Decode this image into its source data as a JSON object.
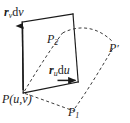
{
  "figure": {
    "background_color": "#ffffff",
    "stroke_color": "#1a1a1a",
    "dashed_color": "#3a3a3a",
    "labels": {
      "rv_dv": {
        "vector": "r",
        "subscript": "v",
        "differential": "dv",
        "text": "r_v dv"
      },
      "ru_du": {
        "vector": "r",
        "subscript": "u",
        "differential": "du",
        "text": "r_u du"
      },
      "P_uv": {
        "point": "P",
        "args": "(u,v)",
        "text": "P(u,v)"
      },
      "P1": {
        "point": "P",
        "subscript": "1",
        "text": "P1"
      },
      "P2": {
        "point": "P",
        "subscript": "2",
        "text": "P2"
      },
      "P_prime": {
        "point": "P",
        "prime": "′",
        "text": "P′"
      }
    },
    "geometry": {
      "parallelogram": {
        "corner_origin": [
          23,
          93
        ],
        "corner_top_left": [
          22,
          22
        ],
        "corner_top_right": [
          73,
          14
        ],
        "corner_bottom_right": [
          78,
          82
        ],
        "style": "solid"
      },
      "arrows": [
        {
          "name": "r_v dv",
          "from": [
            23,
            88
          ],
          "to": [
            22,
            22
          ],
          "direction": "up"
        },
        {
          "name": "r_u du",
          "from": [
            57,
            80
          ],
          "to": [
            78,
            80
          ],
          "direction": "right"
        }
      ],
      "curves": [
        {
          "name": "curve-P-to-P1",
          "style": "dashed"
        },
        {
          "name": "curve-P-to-P2",
          "style": "dashed"
        },
        {
          "name": "curve-P2-to-Pprime",
          "style": "dashed"
        },
        {
          "name": "curve-P1-to-Pprime",
          "style": "dashed"
        }
      ]
    }
  }
}
